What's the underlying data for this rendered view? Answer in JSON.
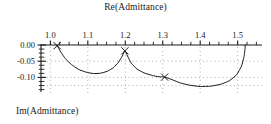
{
  "figure": {
    "width": 271,
    "height": 124,
    "background": "#ffffff",
    "ink_color": "#1a1a1a",
    "grid_color": "#8c8c8c"
  },
  "chart_data": {
    "type": "line",
    "title": "",
    "xlabel": "Re(Admittance)",
    "ylabel": "Im(Admittance)",
    "xlim": [
      0.975,
      1.565
    ],
    "ylim": [
      -0.145,
      0.01
    ],
    "grid": true,
    "grid_style": "dotted",
    "legend": null,
    "xticks_major": [
      1.0,
      1.1,
      1.2,
      1.3,
      1.4,
      1.5
    ],
    "xtick_labels": [
      "1.0",
      "1.1",
      "1.2",
      "1.3",
      "1.4",
      "1.5"
    ],
    "xticks_minor_step": 0.025,
    "yticks_major": [
      0.0,
      -0.05,
      -0.1
    ],
    "ytick_labels": [
      "0.00",
      "-0.05",
      "-0.10"
    ],
    "yticks_minor_step": 0.0125,
    "ygrid_values": [
      -0.05,
      -0.1,
      -0.125
    ],
    "markers": {
      "symbol": "x",
      "points": [
        {
          "x": 1.018,
          "y": -0.002
        },
        {
          "x": 1.199,
          "y": -0.018
        },
        {
          "x": 1.305,
          "y": -0.099
        }
      ]
    },
    "series": [
      {
        "name": "admittance-locus",
        "description": "Three successive resonance loops traced below the real axis",
        "arcs": [
          {
            "x_start": 1.018,
            "x_end": 1.199,
            "y_min": -0.088,
            "y_start": -0.002,
            "y_end": -0.018
          },
          {
            "x_start": 1.199,
            "x_end": 1.305,
            "y_min": -0.099,
            "y_start": -0.018,
            "y_end": -0.099
          },
          {
            "x_start": 1.305,
            "x_end": 1.52,
            "y_min": -0.128,
            "y_start": -0.099,
            "y_end": 0.0
          }
        ],
        "points": [
          {
            "x": 1.018,
            "y": -0.002
          },
          {
            "x": 1.028,
            "y": -0.022
          },
          {
            "x": 1.04,
            "y": -0.042
          },
          {
            "x": 1.056,
            "y": -0.06
          },
          {
            "x": 1.075,
            "y": -0.075
          },
          {
            "x": 1.096,
            "y": -0.084
          },
          {
            "x": 1.115,
            "y": -0.088
          },
          {
            "x": 1.134,
            "y": -0.087
          },
          {
            "x": 1.152,
            "y": -0.081
          },
          {
            "x": 1.168,
            "y": -0.07
          },
          {
            "x": 1.182,
            "y": -0.053
          },
          {
            "x": 1.192,
            "y": -0.034
          },
          {
            "x": 1.199,
            "y": -0.018
          },
          {
            "x": 1.206,
            "y": -0.034
          },
          {
            "x": 1.216,
            "y": -0.056
          },
          {
            "x": 1.231,
            "y": -0.074
          },
          {
            "x": 1.25,
            "y": -0.086
          },
          {
            "x": 1.272,
            "y": -0.094
          },
          {
            "x": 1.29,
            "y": -0.098
          },
          {
            "x": 1.305,
            "y": -0.099
          },
          {
            "x": 1.325,
            "y": -0.107
          },
          {
            "x": 1.347,
            "y": -0.117
          },
          {
            "x": 1.372,
            "y": -0.124
          },
          {
            "x": 1.4,
            "y": -0.128
          },
          {
            "x": 1.428,
            "y": -0.127
          },
          {
            "x": 1.455,
            "y": -0.121
          },
          {
            "x": 1.478,
            "y": -0.11
          },
          {
            "x": 1.497,
            "y": -0.092
          },
          {
            "x": 1.51,
            "y": -0.066
          },
          {
            "x": 1.517,
            "y": -0.036
          },
          {
            "x": 1.52,
            "y": -0.008
          },
          {
            "x": 1.52,
            "y": 0.0
          }
        ]
      }
    ]
  }
}
